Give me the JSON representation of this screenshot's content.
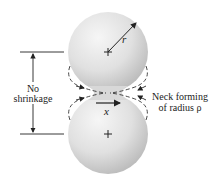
{
  "diagram": {
    "labels": {
      "radius": "r",
      "no_shrinkage_line1": "No",
      "no_shrinkage_line2": "shrinkage",
      "neck_line1": "Neck forming",
      "neck_line2": "of radius ρ",
      "neck_x": "x"
    },
    "colors": {
      "sphere_light": "#f4f4f4",
      "sphere_dark": "#c4c4c4",
      "line": "#222222",
      "background": "#ffffff"
    },
    "spheres": [
      {
        "name": "top-sphere",
        "cx": 108,
        "cy": 52,
        "r": 40
      },
      {
        "name": "bottom-sphere",
        "cx": 108,
        "cy": 134,
        "r": 40
      }
    ]
  }
}
